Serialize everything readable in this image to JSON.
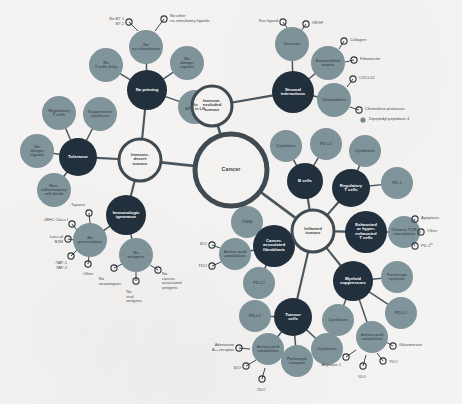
{
  "figure": {
    "background": "#f4f3f1",
    "colors": {
      "hub_ring": "#3f4a52",
      "pheno_ring": "#3f4a52",
      "mechanism": "#21303c",
      "factor": "#7f949b",
      "factor_alt": "#89999d",
      "edge": "#4a565e",
      "marker_ring": "#2b343b",
      "annotation_text": "#4a5055",
      "dot_fill": "#6f8a91"
    }
  },
  "hub": {
    "label": "Cancer",
    "cx": 231,
    "cy": 170,
    "r": 36,
    "ring": 5
  },
  "phenotypes": [
    {
      "id": "desert",
      "label": "Immune-\ndesert\ntumour",
      "cx": 140,
      "cy": 160,
      "r": 21,
      "ring": 3
    },
    {
      "id": "excluded",
      "label": "Immune-\nexcluded\ntumour",
      "cx": 212,
      "cy": 106,
      "r": 20,
      "ring": 3
    },
    {
      "id": "inflamed",
      "label": "Inflamed\ntumour",
      "cx": 313,
      "cy": 231,
      "r": 21,
      "ring": 3
    }
  ],
  "mechanisms": [
    {
      "id": "no-priming",
      "label": "No priming",
      "cx": 147,
      "cy": 90,
      "r": 20,
      "parent": "desert"
    },
    {
      "id": "tolerance",
      "label": "Tolerance",
      "cx": 78,
      "cy": 157,
      "r": 19,
      "parent": "desert"
    },
    {
      "id": "ignorance",
      "label": "Immunologic\nignorance",
      "cx": 126,
      "cy": 215,
      "r": 20,
      "parent": "desert"
    },
    {
      "id": "stromal",
      "label": "Stromal\ninteractions",
      "cx": 293,
      "cy": 92,
      "r": 21,
      "parent": "excluded"
    },
    {
      "id": "bcells",
      "label": "B cells",
      "cx": 305,
      "cy": 181,
      "r": 18,
      "parent": "inflamed"
    },
    {
      "id": "treg",
      "label": "Regulatory\nT cells",
      "cx": 351,
      "cy": 188,
      "r": 19,
      "parent": "inflamed"
    },
    {
      "id": "exhausted",
      "label": "Exhausted\nor hyper-\nexhausted\nT cells",
      "cx": 366,
      "cy": 232,
      "r": 21,
      "parent": "inflamed"
    },
    {
      "id": "myeloid",
      "label": "Myeloid\nsuppressors",
      "cx": 353,
      "cy": 281,
      "r": 20,
      "parent": "inflamed"
    },
    {
      "id": "caf",
      "label": "Cancer-\nassociated\nfibroblasts",
      "cx": 274,
      "cy": 246,
      "r": 21,
      "parent": "inflamed"
    },
    {
      "id": "tumourcells",
      "label": "Tumour\ncells",
      "cx": 293,
      "cy": 317,
      "r": 19,
      "parent": "inflamed"
    }
  ],
  "factors": [
    {
      "id": "f-costim",
      "label": "No\nco-stimulation",
      "cx": 146,
      "cy": 47,
      "r": 17,
      "parent": "no-priming"
    },
    {
      "id": "f-tcellhelp",
      "label": "No\nT cells help",
      "cx": 106,
      "cy": 65,
      "r": 17,
      "parent": "no-priming"
    },
    {
      "id": "f-danger1",
      "label": "No\ndanger\nsignals",
      "cx": 187,
      "cy": 63,
      "r": 17,
      "parent": "no-priming"
    },
    {
      "id": "f-apcln",
      "label": "No\nAPC in LN",
      "cx": 195,
      "cy": 107,
      "r": 17,
      "parent": "no-priming"
    },
    {
      "id": "f-treg1",
      "label": "Regulatory\nT cells",
      "cx": 59,
      "cy": 113,
      "r": 17,
      "parent": "tolerance"
    },
    {
      "id": "f-suppcyto",
      "label": "Suppressive\ncytokines",
      "cx": 100,
      "cy": 114,
      "r": 17,
      "parent": "tolerance"
    },
    {
      "id": "f-danger2",
      "label": "No\ndanger\nsignals",
      "cx": 37,
      "cy": 151,
      "r": 17,
      "parent": "tolerance"
    },
    {
      "id": "f-noninfl",
      "label": "Non-\ninflammatory\ncell death",
      "cx": 54,
      "cy": 190,
      "r": 17,
      "parent": "tolerance"
    },
    {
      "id": "f-nopres",
      "label": "No\npresentation",
      "cx": 90,
      "cy": 240,
      "r": 17,
      "parent": "ignorance"
    },
    {
      "id": "f-noantigen",
      "label": "No\nantigens",
      "cx": 136,
      "cy": 255,
      "r": 17,
      "parent": "ignorance"
    },
    {
      "id": "f-vascular",
      "label": "Vascular",
      "cx": 292,
      "cy": 44,
      "r": 17,
      "parent": "stromal"
    },
    {
      "id": "f-ecm",
      "label": "Extracellular\nmatrix",
      "cx": 328,
      "cy": 63,
      "r": 17,
      "parent": "stromal"
    },
    {
      "id": "f-chemokines",
      "label": "Chemokines",
      "cx": 334,
      "cy": 100,
      "r": 17,
      "parent": "stromal"
    },
    {
      "id": "f-cyto-b",
      "label": "Cytokines",
      "cx": 286,
      "cy": 146,
      "r": 16,
      "parent": "bcells"
    },
    {
      "id": "f-pdl1-b",
      "label": "PD-L1",
      "cx": 326,
      "cy": 144,
      "r": 16,
      "parent": "bcells"
    },
    {
      "id": "f-cyto-treg",
      "label": "Cytokines",
      "cx": 365,
      "cy": 151,
      "r": 16,
      "parent": "treg"
    },
    {
      "id": "f-pd1-treg",
      "label": "PD-1",
      "cx": 397,
      "cy": 183,
      "r": 16,
      "parent": "treg"
    },
    {
      "id": "f-tcr",
      "label": "Chronic TCR\nstimulation",
      "cx": 404,
      "cy": 232,
      "r": 16,
      "parent": "exhausted"
    },
    {
      "id": "f-purin-m",
      "label": "Purinergic\nreceptor",
      "cx": 397,
      "cy": 277,
      "r": 16,
      "parent": "myeloid"
    },
    {
      "id": "f-pdl1-m",
      "label": "PD-L1",
      "cx": 401,
      "cy": 313,
      "r": 16,
      "parent": "myeloid"
    },
    {
      "id": "f-cyto-m",
      "label": "Cytokines",
      "cx": 338,
      "cy": 320,
      "r": 16,
      "parent": "myeloid"
    },
    {
      "id": "f-aac-m",
      "label": "Amino-acid\ncatabolism",
      "cx": 372,
      "cy": 337,
      "r": 16,
      "parent": "myeloid"
    },
    {
      "id": "f-tgfb",
      "label": "TGFβ",
      "cx": 247,
      "cy": 222,
      "r": 16,
      "parent": "caf"
    },
    {
      "id": "f-aac-caf",
      "label": "Amino-acid\ncatabolism",
      "cx": 235,
      "cy": 254,
      "r": 16,
      "parent": "caf"
    },
    {
      "id": "f-pdl1-caf",
      "label": "PD-L1",
      "cx": 259,
      "cy": 283,
      "r": 16,
      "parent": "caf"
    },
    {
      "id": "f-pdl1-t",
      "label": "PD-L1",
      "cx": 255,
      "cy": 316,
      "r": 16,
      "parent": "tumourcells"
    },
    {
      "id": "f-aac-t",
      "label": "Amino-acid\ncatabolism",
      "cx": 268,
      "cy": 349,
      "r": 16,
      "parent": "tumourcells"
    },
    {
      "id": "f-purin-t",
      "label": "Purinergic\nreceptor",
      "cx": 297,
      "cy": 361,
      "r": 16,
      "parent": "tumourcells"
    },
    {
      "id": "f-cyto-t",
      "label": "Cytokines",
      "cx": 327,
      "cy": 349,
      "r": 16,
      "parent": "tumourcells"
    }
  ],
  "annotations": [
    {
      "id": "a-b7",
      "text": "No B7.1\nB7.2",
      "mx": 129,
      "my": 22,
      "tx": 124,
      "ty": 21,
      "side": "l",
      "parent": "f-costim",
      "stem": [
        138,
        31
      ]
    },
    {
      "id": "a-costim-l",
      "text": "No other\nco-stimulatory ligands",
      "mx": 164,
      "my": 19,
      "tx": 170,
      "ty": 18,
      "side": "r",
      "parent": "f-costim",
      "stem": [
        155,
        31
      ]
    },
    {
      "id": "a-tapasin",
      "text": "↓Tapasin",
      "mx": 89,
      "my": 213,
      "tx": 85,
      "ty": 205,
      "side": "l",
      "parent": "f-nopres",
      "stem": [
        90,
        223
      ]
    },
    {
      "id": "a-mhc",
      "text": "↓MHC Class I",
      "mx": 72,
      "my": 224,
      "tx": 68,
      "ty": 220,
      "side": "l",
      "parent": "f-nopres",
      "stem": [
        77,
        230
      ]
    },
    {
      "id": "a-b2m",
      "text": "Loss of\nB2M",
      "mx": 68,
      "my": 239,
      "tx": 63,
      "ty": 239,
      "side": "l",
      "parent": "f-nopres",
      "stem": [
        74,
        240
      ]
    },
    {
      "id": "a-tap",
      "text": "↓TAP-1\nTAP-2",
      "mx": 71,
      "my": 256,
      "tx": 67,
      "ty": 265,
      "side": "l",
      "parent": "f-nopres",
      "stem": [
        77,
        250
      ]
    },
    {
      "id": "a-other-p",
      "text": "Other",
      "mx": 88,
      "my": 264,
      "tx": 88,
      "ty": 272,
      "side": "c",
      "parent": "f-nopres",
      "stem": [
        89,
        256
      ]
    },
    {
      "id": "a-neoag",
      "text": "No\nneoantigens",
      "mx": 114,
      "my": 268,
      "tx": 110,
      "ty": 277,
      "side": "c",
      "parent": "f-noantigen",
      "stem": [
        122,
        264
      ]
    },
    {
      "id": "a-viral",
      "text": "No\nviral\nantigens",
      "mx": 136,
      "my": 281,
      "tx": 134,
      "ty": 290,
      "side": "c",
      "parent": "f-noantigen",
      "stem": [
        136,
        272
      ]
    },
    {
      "id": "a-caag",
      "text": "No\ncancer-\nassociated\nantigens",
      "mx": 158,
      "my": 270,
      "tx": 162,
      "ty": 281,
      "side": "r",
      "parent": "f-noantigen",
      "stem": [
        150,
        265
      ]
    },
    {
      "id": "a-fas",
      "text": "Fas ligand",
      "mx": 283,
      "my": 22,
      "tx": 278,
      "ty": 21,
      "side": "l",
      "parent": "f-vascular",
      "stem": [
        288,
        29
      ]
    },
    {
      "id": "a-vegf",
      "text": "VEGF",
      "mx": 306,
      "my": 24,
      "tx": 312,
      "ty": 23,
      "side": "r",
      "parent": "f-vascular",
      "stem": [
        301,
        31
      ]
    },
    {
      "id": "a-collagen",
      "text": "Collagen",
      "mx": 344,
      "my": 41,
      "tx": 350,
      "ty": 40,
      "side": "r",
      "parent": "f-ecm",
      "stem": [
        339,
        49
      ]
    },
    {
      "id": "a-fibro",
      "text": "Fibronectin",
      "mx": 354,
      "my": 60,
      "tx": 360,
      "ty": 59,
      "side": "r",
      "parent": "f-ecm",
      "stem": [
        345,
        62
      ]
    },
    {
      "id": "a-cxcl12",
      "text": "CXCL12",
      "mx": 353,
      "my": 79,
      "tx": 359,
      "ty": 78,
      "side": "r",
      "parent": "f-chemokines",
      "stem": [
        347,
        87
      ]
    },
    {
      "id": "a-chemprot",
      "text": "Chemokine proteases",
      "mx": 359,
      "my": 110,
      "tx": 365,
      "ty": 109,
      "side": "r",
      "parent": "f-chemokines",
      "stem": [
        350,
        107
      ]
    },
    {
      "id": "a-apoptosis",
      "text": "Apoptosis",
      "mx": 415,
      "my": 219,
      "tx": 421,
      "ty": 218,
      "side": "r",
      "parent": "f-tcr",
      "stem": [
        410,
        225
      ]
    },
    {
      "id": "a-other-t",
      "text": "Other",
      "mx": 421,
      "my": 232,
      "tx": 427,
      "ty": 231,
      "side": "r",
      "parent": "f-tcr",
      "stem": [
        412,
        232
      ]
    },
    {
      "id": "a-pd1hi",
      "text": "PD-1",
      "mx": 415,
      "my": 246,
      "tx": 421,
      "ty": 246,
      "side": "r",
      "parent": "f-tcr",
      "stem": [
        410,
        240
      ],
      "sup": "hi"
    },
    {
      "id": "a-glutam",
      "text": "Glutaminase",
      "mx": 393,
      "my": 346,
      "tx": 399,
      "ty": 345,
      "side": "r",
      "parent": "f-aac-m",
      "stem": [
        386,
        342
      ]
    },
    {
      "id": "a-tdo-m",
      "text": "TDO",
      "mx": 383,
      "my": 361,
      "tx": 389,
      "ty": 362,
      "side": "r",
      "parent": "f-aac-m",
      "stem": [
        377,
        353
      ]
    },
    {
      "id": "a-ido-m",
      "text": "IDO",
      "mx": 363,
      "my": 366,
      "tx": 362,
      "ty": 375,
      "side": "c",
      "parent": "f-aac-m",
      "stem": [
        366,
        355
      ]
    },
    {
      "id": "a-arg1",
      "text": "Arginase 1",
      "mx": 346,
      "my": 357,
      "tx": 341,
      "ty": 365,
      "side": "l",
      "parent": "f-aac-m",
      "stem": [
        356,
        350
      ]
    },
    {
      "id": "a-ido-caf",
      "text": "IDO",
      "mx": 212,
      "my": 245,
      "tx": 207,
      "ty": 244,
      "side": "l",
      "parent": "f-aac-caf",
      "stem": [
        220,
        248
      ]
    },
    {
      "id": "a-tdo-caf",
      "text": "TDO",
      "mx": 212,
      "my": 266,
      "tx": 207,
      "ty": 266,
      "side": "l",
      "parent": "f-aac-caf",
      "stem": [
        221,
        262
      ]
    },
    {
      "id": "a-aden",
      "text": "Adenosine\nA₂ₐ receptor",
      "mx": 239,
      "my": 348,
      "tx": 234,
      "ty": 347,
      "side": "l",
      "parent": "f-aac-t",
      "stem": [
        250,
        349
      ]
    },
    {
      "id": "a-ido-t",
      "text": "IDO",
      "mx": 246,
      "my": 366,
      "tx": 241,
      "ty": 368,
      "side": "l",
      "parent": "f-aac-t",
      "stem": [
        256,
        360
      ]
    },
    {
      "id": "a-tdo-t",
      "text": "TDO",
      "mx": 262,
      "my": 379,
      "tx": 261,
      "ty": 388,
      "side": "c",
      "parent": "f-aac-t",
      "stem": [
        265,
        368
      ]
    }
  ],
  "dot_annotations": [
    {
      "id": "d-dpp4",
      "text": "Dipeptidyl peptidase 4",
      "dx": 363,
      "dy": 120,
      "tx": 369,
      "ty": 119
    }
  ]
}
